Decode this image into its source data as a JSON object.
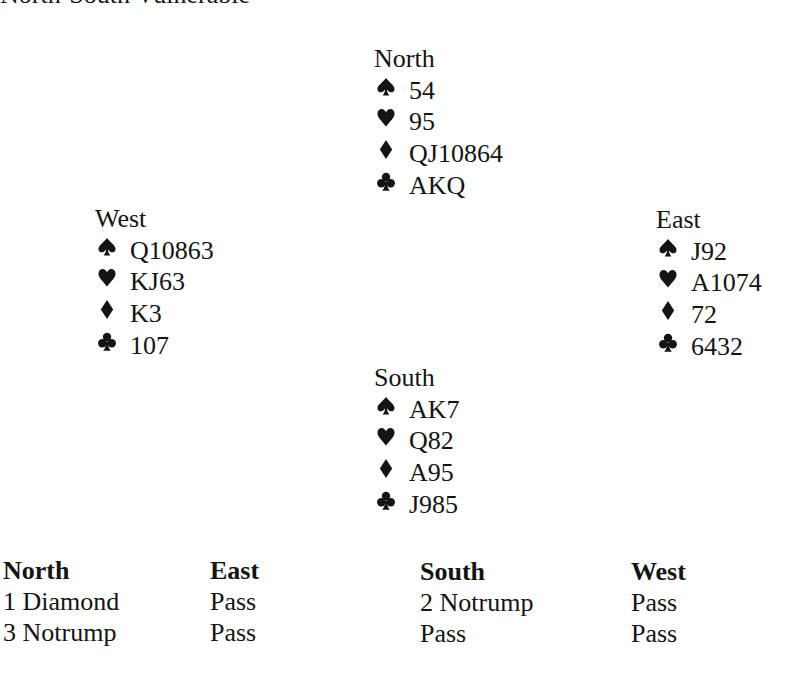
{
  "header": {
    "vulnerability": "North-South Vulnerable"
  },
  "hands": {
    "north": {
      "label": "North",
      "spades": "54",
      "hearts": "95",
      "diamonds": "QJ10864",
      "clubs": "AKQ"
    },
    "west": {
      "label": "West",
      "spades": "Q10863",
      "hearts": "KJ63",
      "diamonds": "K3",
      "clubs": "107"
    },
    "east": {
      "label": "East",
      "spades": "J92",
      "hearts": "A1074",
      "diamonds": "72",
      "clubs": "6432"
    },
    "south": {
      "label": "South",
      "spades": "AK7",
      "hearts": "Q82",
      "diamonds": "A95",
      "clubs": "J985"
    }
  },
  "suit_icons": {
    "spades": "spade-icon",
    "hearts": "heart-icon",
    "diamonds": "diamond-icon",
    "clubs": "club-icon"
  },
  "auction": {
    "columns": [
      {
        "header": "North",
        "bids": [
          "1 Diamond",
          "3 Notrump"
        ]
      },
      {
        "header": "East",
        "bids": [
          "Pass",
          "Pass"
        ]
      },
      {
        "header": "South",
        "bids": [
          "2 Notrump",
          "Pass"
        ]
      },
      {
        "header": "West",
        "bids": [
          "Pass",
          "Pass"
        ]
      }
    ]
  },
  "colors": {
    "text": "#141414",
    "background": "#ffffff"
  }
}
